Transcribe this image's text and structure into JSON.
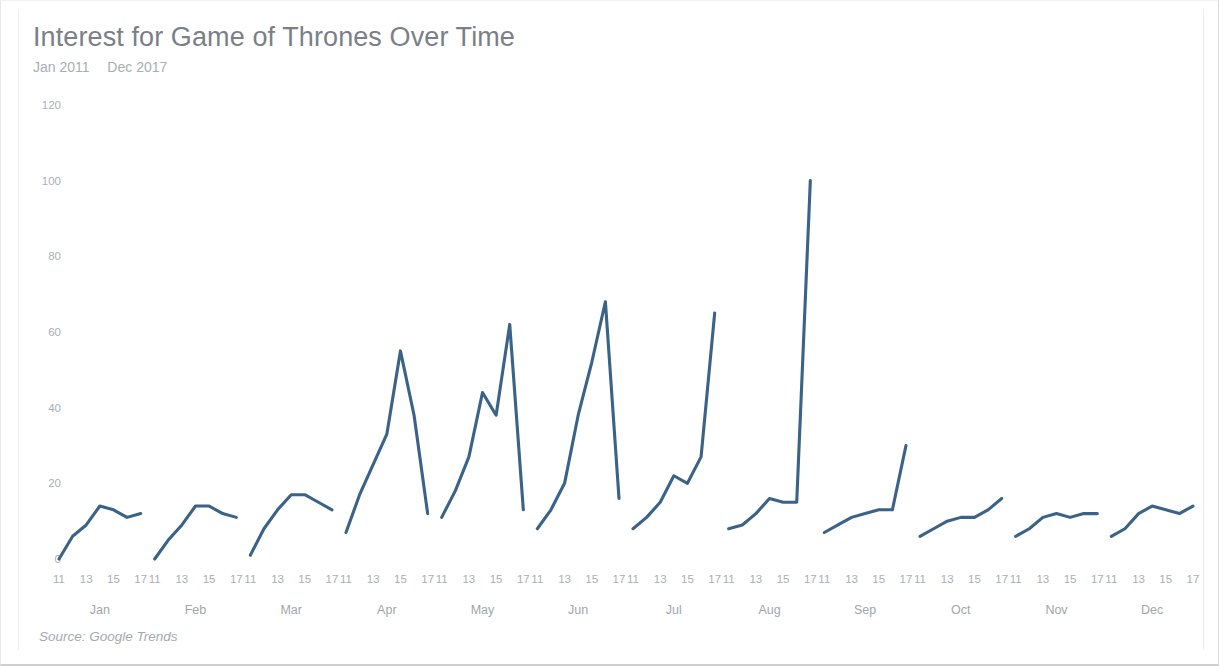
{
  "header": {
    "title": "Interest for Game of Thrones Over Time",
    "subtitle_start": "Jan 2011",
    "subtitle_end": "Dec 2017"
  },
  "footer": {
    "source": "Source: Google Trends"
  },
  "style": {
    "line_color": "#3b6287",
    "title_color": "#7a8088",
    "subtitle_color": "#a8aeb5",
    "tick_color": "#a9afb6",
    "background": "#ffffff"
  },
  "chart_data": {
    "type": "line",
    "title": "Interest for Game of Thrones Over Time",
    "subtitle": "Jan 2011  Dec 2017",
    "source": "Source: Google Trends",
    "xlabel": "",
    "ylabel": "",
    "ylim": [
      0,
      120
    ],
    "yticks": [
      0,
      20,
      40,
      60,
      80,
      100,
      120
    ],
    "grid": false,
    "legend": false,
    "x_group_labels": [
      "Jan",
      "Feb",
      "Mar",
      "Apr",
      "May",
      "Jun",
      "Jul",
      "Aug",
      "Sep",
      "Oct",
      "Nov",
      "Dec"
    ],
    "x_year_ticks": [
      "11",
      "13",
      "15",
      "17"
    ],
    "x_years_all": [
      2011,
      2012,
      2013,
      2014,
      2015,
      2016,
      2017
    ],
    "note": "One small-multiple line per month; x within each panel is year 2011..2017, y is Google Trends interest index.",
    "series": [
      {
        "name": "Jan",
        "x": [
          2011,
          2012,
          2013,
          2014,
          2015,
          2016,
          2017
        ],
        "values": [
          0,
          6,
          9,
          14,
          13,
          11,
          12
        ]
      },
      {
        "name": "Feb",
        "x": [
          2011,
          2012,
          2013,
          2014,
          2015,
          2016,
          2017
        ],
        "values": [
          0,
          5,
          9,
          14,
          14,
          12,
          11
        ]
      },
      {
        "name": "Mar",
        "x": [
          2011,
          2012,
          2013,
          2014,
          2015,
          2016,
          2017
        ],
        "values": [
          1,
          8,
          13,
          17,
          17,
          15,
          13
        ]
      },
      {
        "name": "Apr",
        "x": [
          2011,
          2012,
          2013,
          2014,
          2015,
          2016,
          2017
        ],
        "values": [
          7,
          17,
          25,
          33,
          55,
          38,
          12
        ]
      },
      {
        "name": "May",
        "x": [
          2011,
          2012,
          2013,
          2014,
          2015,
          2016,
          2017
        ],
        "values": [
          11,
          18,
          27,
          44,
          38,
          62,
          13
        ]
      },
      {
        "name": "Jun",
        "x": [
          2011,
          2012,
          2013,
          2014,
          2015,
          2016,
          2017
        ],
        "values": [
          8,
          13,
          20,
          38,
          52,
          68,
          16
        ]
      },
      {
        "name": "Jul",
        "x": [
          2011,
          2012,
          2013,
          2014,
          2015,
          2016,
          2017
        ],
        "values": [
          8,
          11,
          15,
          22,
          20,
          27,
          65
        ]
      },
      {
        "name": "Aug",
        "x": [
          2011,
          2012,
          2013,
          2014,
          2015,
          2016,
          2017
        ],
        "values": [
          8,
          9,
          12,
          16,
          15,
          15,
          100
        ]
      },
      {
        "name": "Sep",
        "x": [
          2011,
          2012,
          2013,
          2014,
          2015,
          2016,
          2017
        ],
        "values": [
          7,
          9,
          11,
          12,
          13,
          13,
          30
        ]
      },
      {
        "name": "Oct",
        "x": [
          2011,
          2012,
          2013,
          2014,
          2015,
          2016,
          2017
        ],
        "values": [
          6,
          8,
          10,
          11,
          11,
          13,
          16
        ]
      },
      {
        "name": "Nov",
        "x": [
          2011,
          2012,
          2013,
          2014,
          2015,
          2016,
          2017
        ],
        "values": [
          6,
          8,
          11,
          12,
          11,
          12,
          12
        ]
      },
      {
        "name": "Dec",
        "x": [
          2011,
          2012,
          2013,
          2014,
          2015,
          2016,
          2017
        ],
        "values": [
          6,
          8,
          12,
          14,
          13,
          12,
          14
        ]
      }
    ]
  },
  "layout": {
    "plot_left": 58,
    "plot_right": 1192,
    "y_zero_px": 558,
    "y_top_value": 120,
    "y_top_px": 104,
    "panel_gap_px": 14,
    "year_label_y": 572,
    "month_label_y": 602
  }
}
